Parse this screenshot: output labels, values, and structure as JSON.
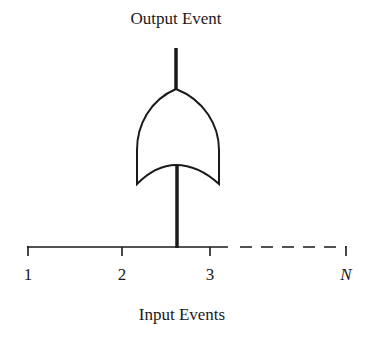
{
  "diagram": {
    "type": "fault-tree-or-gate",
    "output_label": "Output Event",
    "input_label": "Input Events",
    "gate": "OR",
    "input_ticks": [
      {
        "label": "1",
        "x": 28
      },
      {
        "label": "2",
        "x": 122
      },
      {
        "label": "3",
        "x": 210
      },
      {
        "label": "N",
        "x": 346
      }
    ],
    "colors": {
      "stroke": "#1a1a1a",
      "background": "#ffffff"
    }
  }
}
